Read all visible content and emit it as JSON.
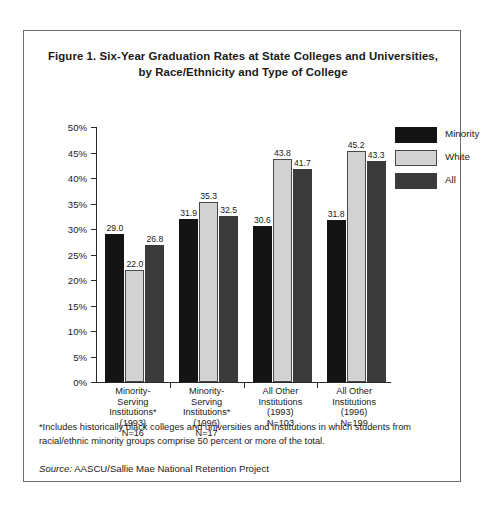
{
  "figure": {
    "title_line1": "Figure 1. Six-Year Graduation Rates at State Colleges and Universities,",
    "title_line2": "by Race/Ethnicity and Type of College",
    "footnote": "*Includes historically black colleges and universities and institutions in which students from racial/ethnic minority groups comprise 50 percent or more of the total.",
    "source_keyword": "Source:",
    "source_text": " AASCU/Sallie Mae National Retention Project",
    "border_color": "#6d6d6d"
  },
  "chart_data": {
    "type": "bar",
    "title": "Figure 1. Six-Year Graduation Rates at State Colleges and Universities, by Race/Ethnicity and Type of College",
    "xlabel": "",
    "ylabel": "",
    "ylim": [
      0,
      50
    ],
    "ytick_step": 5,
    "ytick_labels": [
      "0%",
      "5%",
      "10%",
      "15%",
      "20%",
      "25%",
      "30%",
      "35%",
      "40%",
      "45%",
      "50%"
    ],
    "ytick_values": [
      0,
      5,
      10,
      15,
      20,
      25,
      30,
      35,
      40,
      45,
      50
    ],
    "grid": false,
    "legend_position": "right",
    "categories": [
      "Minority-Serving Institutions* (1993) N=16",
      "Minority-Serving Institutions* (1996) N=17",
      "All Other Institutions (1993) N=103",
      "All Other Institutions (1996) N=199"
    ],
    "category_lines": [
      [
        "Minority-",
        "Serving",
        "Institutions*",
        "(1993)",
        "N=16"
      ],
      [
        "Minority-",
        "Serving",
        "Institutions*",
        "(1996)",
        "N=17"
      ],
      [
        "All Other",
        "Institutions",
        "(1993)",
        "N=103"
      ],
      [
        "All Other",
        "Institutions",
        "(1996)",
        "N=199"
      ]
    ],
    "series": [
      {
        "name": "Minority",
        "color": "#141414",
        "values": [
          29.0,
          31.9,
          30.6,
          31.8
        ],
        "labels": [
          "29.0",
          "31.9",
          "30.6",
          "31.8"
        ]
      },
      {
        "name": "White",
        "color": "#d2d2d2",
        "values": [
          22.0,
          35.3,
          43.8,
          45.2
        ],
        "labels": [
          "22.0",
          "35.3",
          "43.8",
          "45.2"
        ]
      },
      {
        "name": "All",
        "color": "#3b3b3b",
        "values": [
          26.8,
          32.5,
          41.7,
          43.3
        ],
        "labels": [
          "26.8",
          "32.5",
          "41.7",
          "43.3"
        ]
      }
    ]
  }
}
